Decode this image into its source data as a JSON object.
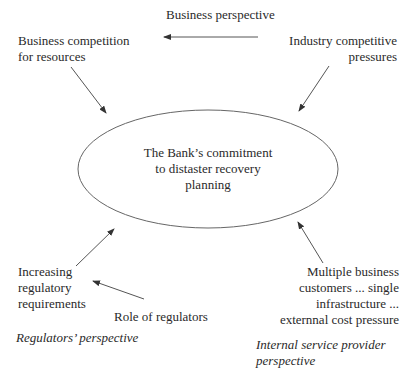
{
  "diagram": {
    "center_node": {
      "lines": [
        "The Bank’s commitment",
        "to distaster recovery",
        "planning"
      ]
    },
    "nodes": {
      "business_perspective": {
        "lines": [
          "Business perspective"
        ]
      },
      "business_competition": {
        "lines": [
          "Business competition",
          "for resources"
        ]
      },
      "industry_pressures": {
        "lines": [
          "Industry competitive",
          "pressures"
        ]
      },
      "regulatory_requirements": {
        "lines": [
          "Increasing",
          "regulatory",
          "requirements"
        ]
      },
      "role_of_regulators": {
        "lines": [
          "Role of regulators"
        ]
      },
      "multiple_customers": {
        "lines": [
          "Multiple business",
          "customers ... single",
          "infrastructure ...",
          "externnal cost pressure"
        ]
      }
    },
    "perspectives": {
      "regulators": {
        "lines": [
          "Regulators’ perspective"
        ]
      },
      "internal_provider": {
        "lines": [
          "Internal service provider",
          "perspective"
        ]
      }
    },
    "edges": [
      {
        "from": "industry_pressures",
        "to": "business_competition",
        "note": "horizontal arrow under Business perspective"
      },
      {
        "from": "business_competition",
        "to": "center_node"
      },
      {
        "from": "industry_pressures",
        "to": "center_node"
      },
      {
        "from": "regulatory_requirements",
        "to": "center_node"
      },
      {
        "from": "role_of_regulators",
        "to": "regulatory_requirements"
      },
      {
        "from": "multiple_customers",
        "to": "center_node"
      }
    ],
    "colors": {
      "line": "#555555",
      "text": "#2a2a2a",
      "background": "#ffffff"
    }
  }
}
